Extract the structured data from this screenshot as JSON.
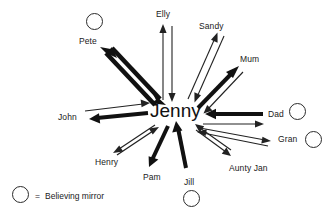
{
  "diagram": {
    "type": "radial-relationship-map",
    "center": {
      "name": "Jenny",
      "x": 178,
      "y": 112
    },
    "nodes": [
      {
        "id": "pete",
        "label": "Pete",
        "label_x": 79,
        "label_y": 37,
        "has_mirror": true,
        "mirror_x": 86,
        "mirror_y": 13,
        "mirror_size": 17,
        "arrow_style": "thick-double"
      },
      {
        "id": "elly",
        "label": "Elly",
        "label_x": 156,
        "label_y": 10,
        "has_mirror": false,
        "arrow_style": "thin-double"
      },
      {
        "id": "sandy",
        "label": "Sandy",
        "label_x": 199,
        "label_y": 22,
        "has_mirror": false,
        "arrow_style": "thin-double"
      },
      {
        "id": "mum",
        "label": "Mum",
        "label_x": 240,
        "label_y": 55,
        "has_mirror": false,
        "arrow_style": "thick-out-thin-in"
      },
      {
        "id": "dad",
        "label": "Dad",
        "label_x": 268,
        "label_y": 110,
        "has_mirror": true,
        "mirror_x": 289,
        "mirror_y": 103,
        "mirror_size": 17,
        "arrow_style": "thick-in-thin-out"
      },
      {
        "id": "gran",
        "label": "Gran",
        "label_x": 278,
        "label_y": 135,
        "has_mirror": true,
        "mirror_x": 305,
        "mirror_y": 131,
        "mirror_size": 17,
        "arrow_style": "thin-double"
      },
      {
        "id": "aunty-jan",
        "label": "Aunty Jan",
        "label_x": 229,
        "label_y": 164,
        "has_mirror": false,
        "arrow_style": "thin-double"
      },
      {
        "id": "jill",
        "label": "Jill",
        "label_x": 184,
        "label_y": 178,
        "has_mirror": true,
        "mirror_x": 183,
        "mirror_y": 190,
        "mirror_size": 17,
        "arrow_style": "thick-in"
      },
      {
        "id": "pam",
        "label": "Pam",
        "label_x": 143,
        "label_y": 173,
        "has_mirror": false,
        "arrow_style": "thick-out"
      },
      {
        "id": "henry",
        "label": "Henry",
        "label_x": 95,
        "label_y": 158,
        "has_mirror": false,
        "arrow_style": "thin-double"
      },
      {
        "id": "john",
        "label": "John",
        "label_x": 58,
        "label_y": 113,
        "has_mirror": true,
        "mirror_x": null,
        "arrow_style": "thick-out-thin-in"
      }
    ]
  },
  "legend": {
    "symbol_name": "circle",
    "equals": "=",
    "text": "Believing mirror",
    "circle_x": 12,
    "circle_y": 186,
    "circle_size": 17,
    "text_x": 35,
    "text_y": 192
  },
  "colors": {
    "background": "#ffffff",
    "stroke": "#111111",
    "text": "#1a1a1a",
    "thin_stroke": "#222222"
  }
}
